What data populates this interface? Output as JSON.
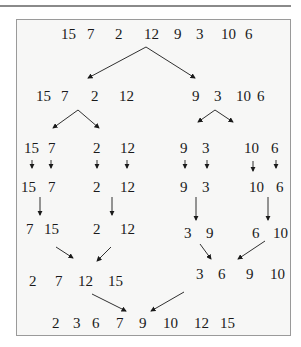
{
  "input": [
    15,
    7,
    2,
    12,
    9,
    3,
    10,
    6
  ],
  "levels": [
    {
      "name": "input",
      "items": [
        {
          "v": "15",
          "x": 61,
          "y": 26
        },
        {
          "v": "7",
          "x": 87,
          "y": 26
        },
        {
          "v": "2",
          "x": 115,
          "y": 26
        },
        {
          "v": "12",
          "x": 144,
          "y": 26
        },
        {
          "v": "9",
          "x": 174,
          "y": 26
        },
        {
          "v": "3",
          "x": 196,
          "y": 26
        },
        {
          "v": "10",
          "x": 221,
          "y": 26
        },
        {
          "v": "6",
          "x": 245,
          "y": 26
        }
      ]
    },
    {
      "name": "split-halves",
      "items": [
        {
          "v": "15",
          "x": 36,
          "y": 88
        },
        {
          "v": "7",
          "x": 61,
          "y": 88
        },
        {
          "v": "2",
          "x": 91,
          "y": 88
        },
        {
          "v": "12",
          "x": 119,
          "y": 88
        },
        {
          "v": "9",
          "x": 192,
          "y": 88
        },
        {
          "v": "3",
          "x": 214,
          "y": 88
        },
        {
          "v": "10",
          "x": 236,
          "y": 88
        },
        {
          "v": "6",
          "x": 257,
          "y": 88
        }
      ]
    },
    {
      "name": "split-quarters",
      "items": [
        {
          "v": "15",
          "x": 24,
          "y": 140
        },
        {
          "v": "7",
          "x": 48,
          "y": 140
        },
        {
          "v": "2",
          "x": 93,
          "y": 140
        },
        {
          "v": "12",
          "x": 120,
          "y": 140
        },
        {
          "v": "9",
          "x": 180,
          "y": 140
        },
        {
          "v": "3",
          "x": 202,
          "y": 140
        },
        {
          "v": "10",
          "x": 244,
          "y": 140
        },
        {
          "v": "6",
          "x": 271,
          "y": 140
        }
      ]
    },
    {
      "name": "singletons",
      "items": [
        {
          "v": "15",
          "x": 21,
          "y": 179
        },
        {
          "v": "7",
          "x": 48,
          "y": 179
        },
        {
          "v": "2",
          "x": 93,
          "y": 179
        },
        {
          "v": "12",
          "x": 120,
          "y": 179
        },
        {
          "v": "9",
          "x": 180,
          "y": 179
        },
        {
          "v": "3",
          "x": 202,
          "y": 179
        },
        {
          "v": "10",
          "x": 249,
          "y": 179
        },
        {
          "v": "6",
          "x": 276,
          "y": 179
        }
      ]
    },
    {
      "name": "merged-pairs",
      "items": [
        {
          "v": "7",
          "x": 26,
          "y": 221
        },
        {
          "v": "15",
          "x": 44,
          "y": 221
        },
        {
          "v": "2",
          "x": 93,
          "y": 221
        },
        {
          "v": "12",
          "x": 120,
          "y": 221
        },
        {
          "v": "3",
          "x": 184,
          "y": 225
        },
        {
          "v": "9",
          "x": 206,
          "y": 225
        },
        {
          "v": "6",
          "x": 252,
          "y": 225
        },
        {
          "v": "10",
          "x": 273,
          "y": 225
        }
      ]
    },
    {
      "name": "merged-quads",
      "items": [
        {
          "v": "2",
          "x": 29,
          "y": 273
        },
        {
          "v": "7",
          "x": 55,
          "y": 273
        },
        {
          "v": "12",
          "x": 78,
          "y": 273
        },
        {
          "v": "15",
          "x": 108,
          "y": 273
        },
        {
          "v": "3",
          "x": 196,
          "y": 266
        },
        {
          "v": "6",
          "x": 218,
          "y": 266
        },
        {
          "v": "9",
          "x": 246,
          "y": 266
        },
        {
          "v": "10",
          "x": 270,
          "y": 266
        }
      ]
    },
    {
      "name": "sorted-output",
      "items": [
        {
          "v": "2",
          "x": 52,
          "y": 315
        },
        {
          "v": "3",
          "x": 73,
          "y": 315
        },
        {
          "v": "6",
          "x": 92,
          "y": 315
        },
        {
          "v": "7",
          "x": 116,
          "y": 315
        },
        {
          "v": "9",
          "x": 139,
          "y": 315
        },
        {
          "v": "10",
          "x": 163,
          "y": 315
        },
        {
          "v": "12",
          "x": 194,
          "y": 315
        },
        {
          "v": "15",
          "x": 220,
          "y": 315
        }
      ]
    }
  ],
  "output": [
    2,
    3,
    6,
    7,
    9,
    10,
    12,
    15
  ],
  "colors": {
    "frame_bg": "#f7f7f6",
    "frame_border": "#9a9a9a",
    "ink": "#1a1a1a"
  }
}
